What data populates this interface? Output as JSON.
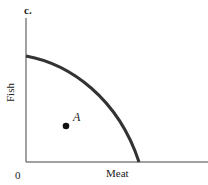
{
  "panel": {
    "label": "c."
  },
  "axes": {
    "y_label": "Fish",
    "x_label": "Meat",
    "origin_label": "0"
  },
  "point": {
    "label": "A"
  },
  "colors": {
    "curve": "#333333",
    "axis": "#444444",
    "point": "#111111"
  }
}
